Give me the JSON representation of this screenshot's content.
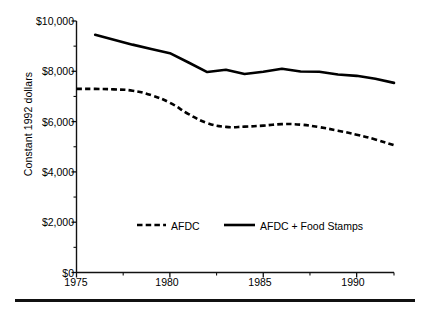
{
  "chart_data": {
    "type": "line",
    "title": "",
    "xlabel": "",
    "ylabel": "Constant 1992 dollars",
    "xlim": [
      1975,
      1992
    ],
    "ylim": [
      0,
      10000
    ],
    "grid": false,
    "legend_position": "inside-bottom",
    "y_ticks": [
      0,
      2000,
      4000,
      6000,
      8000,
      10000
    ],
    "y_tick_labels": [
      "$0",
      "$2,000",
      "$4,000",
      "$6,000",
      "$8,000",
      "$10,000"
    ],
    "y_minor_ticks": [
      1000,
      3000,
      5000,
      7000,
      9000
    ],
    "x_ticks": [
      1975,
      1980,
      1985,
      1990
    ],
    "x_tick_labels": [
      "1975",
      "1980",
      "1985",
      "1990"
    ],
    "x_minor_ticks": [
      1977.5,
      1982.5,
      1987.5,
      1992
    ],
    "series": [
      {
        "name": "AFDC",
        "style": "dashed",
        "x": [
          1975,
          1976,
          1977,
          1978,
          1979,
          1980,
          1981,
          1982,
          1983,
          1984,
          1985,
          1986,
          1987,
          1988,
          1989,
          1990,
          1991,
          1992
        ],
        "values": [
          7300,
          7300,
          7280,
          7230,
          7050,
          6750,
          6300,
          5940,
          5790,
          5800,
          5840,
          5900,
          5880,
          5780,
          5640,
          5480,
          5290,
          5060
        ]
      },
      {
        "name": "AFDC + Food Stamps",
        "style": "solid",
        "x": [
          1976,
          1977,
          1978,
          1979,
          1980,
          1981,
          1982,
          1983,
          1984,
          1985,
          1986,
          1987,
          1988,
          1989,
          1990,
          1991,
          1992
        ],
        "values": [
          9450,
          9250,
          9060,
          8890,
          8720,
          8350,
          7970,
          8060,
          7890,
          7980,
          8100,
          7990,
          7980,
          7870,
          7820,
          7700,
          7540
        ]
      }
    ]
  },
  "axis": {
    "y_label": "Constant 1992 dollars",
    "y_tick_0": "$0",
    "y_tick_1": "$2,000",
    "y_tick_2": "$4,000",
    "y_tick_3": "$6,000",
    "y_tick_4": "$8,000",
    "y_tick_5": "$10,000",
    "x_tick_0": "1975",
    "x_tick_1": "1980",
    "x_tick_2": "1985",
    "x_tick_3": "1990"
  },
  "legend": {
    "item_1_label": "AFDC",
    "item_2_label": "AFDC + Food Stamps"
  },
  "colors": {
    "ink": "#000000",
    "axis": "#111111",
    "background": "#ffffff"
  }
}
